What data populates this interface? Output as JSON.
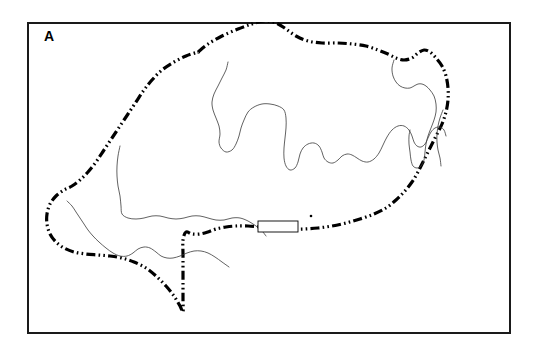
{
  "figure": {
    "panel_label": "A",
    "background_color": "#ffffff",
    "frame_color": "#1a1a1a",
    "boundary_color": "#000000",
    "contour_color": "#3a3a3a",
    "frame": {
      "x": 27,
      "y": 22,
      "width": 484,
      "height": 312
    }
  },
  "chart_data": {
    "type": "map",
    "title": "A",
    "xlabel": "",
    "ylabel": "",
    "grid": false,
    "legend": "none",
    "layers": [
      {
        "name": "island-boundary",
        "style": "dash-dot-dot",
        "stroke_width": 3.2,
        "color": "#000000",
        "closed": true,
        "points": [
          [
            198,
            52
          ],
          [
            208,
            44
          ],
          [
            222,
            36
          ],
          [
            238,
            29
          ],
          [
            252,
            24
          ],
          [
            264,
            21
          ],
          [
            276,
            23
          ],
          [
            286,
            29
          ],
          [
            296,
            36
          ],
          [
            308,
            41
          ],
          [
            322,
            43
          ],
          [
            338,
            43
          ],
          [
            352,
            44
          ],
          [
            366,
            46
          ],
          [
            378,
            50
          ],
          [
            388,
            54
          ],
          [
            396,
            58
          ],
          [
            404,
            60
          ],
          [
            412,
            58
          ],
          [
            418,
            53
          ],
          [
            424,
            50
          ],
          [
            430,
            52
          ],
          [
            436,
            58
          ],
          [
            442,
            66
          ],
          [
            446,
            76
          ],
          [
            448,
            88
          ],
          [
            448,
            100
          ],
          [
            446,
            112
          ],
          [
            442,
            124
          ],
          [
            436,
            136
          ],
          [
            430,
            148
          ],
          [
            424,
            160
          ],
          [
            418,
            172
          ],
          [
            412,
            182
          ],
          [
            404,
            192
          ],
          [
            396,
            200
          ],
          [
            386,
            208
          ],
          [
            374,
            214
          ],
          [
            360,
            219
          ],
          [
            346,
            223
          ],
          [
            332,
            226
          ],
          [
            318,
            228
          ],
          [
            304,
            229
          ],
          [
            290,
            229
          ],
          [
            276,
            228
          ],
          [
            262,
            227
          ],
          [
            248,
            226
          ],
          [
            236,
            226
          ],
          [
            226,
            227
          ],
          [
            216,
            229
          ],
          [
            208,
            232
          ],
          [
            200,
            234
          ],
          [
            192,
            234
          ],
          [
            186,
            232
          ],
          [
            183,
            240
          ],
          [
            183,
            254
          ],
          [
            183,
            270
          ],
          [
            183,
            286
          ],
          [
            183,
            300
          ],
          [
            183,
            312
          ],
          [
            180,
            306
          ],
          [
            174,
            296
          ],
          [
            166,
            286
          ],
          [
            156,
            276
          ],
          [
            146,
            268
          ],
          [
            134,
            262
          ],
          [
            122,
            258
          ],
          [
            110,
            256
          ],
          [
            98,
            255
          ],
          [
            86,
            254
          ],
          [
            74,
            252
          ],
          [
            64,
            248
          ],
          [
            56,
            242
          ],
          [
            50,
            234
          ],
          [
            47,
            224
          ],
          [
            47,
            214
          ],
          [
            50,
            204
          ],
          [
            56,
            196
          ],
          [
            64,
            190
          ],
          [
            72,
            186
          ],
          [
            80,
            180
          ],
          [
            88,
            172
          ],
          [
            96,
            162
          ],
          [
            104,
            150
          ],
          [
            112,
            138
          ],
          [
            120,
            126
          ],
          [
            128,
            114
          ],
          [
            136,
            102
          ],
          [
            144,
            90
          ],
          [
            152,
            80
          ],
          [
            162,
            70
          ],
          [
            174,
            62
          ],
          [
            186,
            56
          ],
          [
            198,
            52
          ]
        ]
      },
      {
        "name": "interior-contour-north",
        "style": "solid",
        "stroke_width": 0.8,
        "color": "#3a3a3a",
        "closed": false,
        "points": [
          [
            228,
            62
          ],
          [
            226,
            70
          ],
          [
            222,
            78
          ],
          [
            218,
            86
          ],
          [
            214,
            94
          ],
          [
            212,
            102
          ],
          [
            213,
            110
          ],
          [
            216,
            118
          ],
          [
            219,
            126
          ],
          [
            220,
            134
          ],
          [
            219,
            142
          ],
          [
            221,
            148
          ],
          [
            226,
            152
          ],
          [
            232,
            150
          ],
          [
            236,
            144
          ],
          [
            239,
            136
          ],
          [
            241,
            128
          ],
          [
            244,
            120
          ],
          [
            248,
            112
          ],
          [
            254,
            107
          ],
          [
            262,
            104
          ],
          [
            270,
            104
          ],
          [
            278,
            106
          ],
          [
            284,
            110
          ],
          [
            286,
            118
          ],
          [
            286,
            128
          ],
          [
            285,
            138
          ],
          [
            284,
            148
          ],
          [
            284,
            158
          ],
          [
            286,
            166
          ],
          [
            290,
            170
          ],
          [
            295,
            168
          ],
          [
            298,
            162
          ],
          [
            300,
            154
          ],
          [
            303,
            148
          ],
          [
            308,
            144
          ],
          [
            314,
            143
          ],
          [
            319,
            146
          ],
          [
            322,
            152
          ],
          [
            324,
            158
          ],
          [
            328,
            162
          ],
          [
            333,
            163
          ],
          [
            338,
            160
          ],
          [
            342,
            156
          ],
          [
            347,
            154
          ],
          [
            352,
            155
          ],
          [
            357,
            158
          ],
          [
            362,
            161
          ],
          [
            368,
            162
          ],
          [
            374,
            159
          ],
          [
            379,
            153
          ],
          [
            383,
            145
          ],
          [
            387,
            137
          ],
          [
            392,
            130
          ],
          [
            398,
            126
          ],
          [
            404,
            126
          ],
          [
            409,
            130
          ],
          [
            412,
            136
          ],
          [
            414,
            142
          ],
          [
            417,
            146
          ],
          [
            421,
            147
          ],
          [
            425,
            144
          ],
          [
            428,
            138
          ],
          [
            431,
            132
          ],
          [
            435,
            128
          ],
          [
            440,
            127
          ],
          [
            444,
            130
          ],
          [
            446,
            136
          ]
        ]
      },
      {
        "name": "interior-contour-northeast-inlet",
        "style": "solid",
        "stroke_width": 0.8,
        "color": "#3a3a3a",
        "closed": false,
        "points": [
          [
            394,
            60
          ],
          [
            392,
            68
          ],
          [
            393,
            76
          ],
          [
            396,
            82
          ],
          [
            400,
            86
          ],
          [
            405,
            88
          ],
          [
            410,
            88
          ],
          [
            414,
            86
          ],
          [
            418,
            84
          ],
          [
            422,
            84
          ],
          [
            426,
            86
          ],
          [
            430,
            90
          ],
          [
            434,
            96
          ],
          [
            436,
            104
          ],
          [
            436,
            112
          ],
          [
            434,
            120
          ],
          [
            431,
            128
          ],
          [
            428,
            136
          ],
          [
            426,
            144
          ],
          [
            425,
            152
          ],
          [
            424,
            160
          ],
          [
            421,
            166
          ],
          [
            417,
            168
          ],
          [
            413,
            166
          ],
          [
            411,
            160
          ],
          [
            410,
            152
          ],
          [
            409,
            144
          ],
          [
            409,
            136
          ],
          [
            410,
            130
          ]
        ]
      },
      {
        "name": "interior-contour-southwest",
        "style": "solid",
        "stroke_width": 0.8,
        "color": "#3a3a3a",
        "closed": false,
        "points": [
          [
            120,
            146
          ],
          [
            118,
            156
          ],
          [
            117,
            166
          ],
          [
            117,
            176
          ],
          [
            118,
            186
          ],
          [
            120,
            196
          ],
          [
            121,
            206
          ],
          [
            122,
            214
          ],
          [
            128,
            218
          ],
          [
            136,
            219
          ],
          [
            144,
            218
          ],
          [
            152,
            216
          ],
          [
            160,
            216
          ],
          [
            168,
            218
          ],
          [
            176,
            219
          ],
          [
            184,
            218
          ],
          [
            192,
            216
          ],
          [
            200,
            216
          ],
          [
            208,
            218
          ],
          [
            216,
            220
          ],
          [
            224,
            220
          ],
          [
            232,
            218
          ],
          [
            240,
            218
          ],
          [
            248,
            221
          ],
          [
            256,
            226
          ],
          [
            262,
            231
          ],
          [
            266,
            236
          ]
        ]
      },
      {
        "name": "interior-contour-west-peninsula",
        "style": "solid",
        "stroke_width": 0.8,
        "color": "#3a3a3a",
        "closed": false,
        "points": [
          [
            67,
            201
          ],
          [
            72,
            206
          ],
          [
            76,
            212
          ],
          [
            80,
            218
          ],
          [
            84,
            224
          ],
          [
            88,
            230
          ],
          [
            93,
            236
          ],
          [
            99,
            242
          ],
          [
            106,
            248
          ],
          [
            113,
            253
          ],
          [
            120,
            256
          ],
          [
            127,
            256
          ],
          [
            133,
            253
          ],
          [
            138,
            249
          ],
          [
            144,
            247
          ],
          [
            150,
            248
          ],
          [
            156,
            252
          ],
          [
            161,
            256
          ],
          [
            167,
            258
          ],
          [
            173,
            258
          ],
          [
            180,
            256
          ],
          [
            187,
            253
          ],
          [
            194,
            251
          ],
          [
            201,
            251
          ],
          [
            208,
            253
          ],
          [
            215,
            257
          ],
          [
            222,
            262
          ],
          [
            229,
            267
          ]
        ]
      },
      {
        "name": "interior-contour-northeast-tail",
        "style": "solid",
        "stroke_width": 0.8,
        "color": "#3a3a3a",
        "closed": false,
        "points": [
          [
            443,
            110
          ],
          [
            440,
            118
          ],
          [
            438,
            126
          ],
          [
            437,
            134
          ],
          [
            437,
            142
          ],
          [
            438,
            150
          ],
          [
            440,
            158
          ],
          [
            441,
            166
          ]
        ]
      }
    ],
    "markers": [
      {
        "name": "rectangle-marker",
        "shape": "rectangle",
        "x": 258,
        "y": 221,
        "width": 40,
        "height": 11,
        "fill": "#ffffff",
        "stroke": "#000000"
      },
      {
        "name": "point-marker",
        "shape": "dot",
        "x": 311,
        "y": 216,
        "radius": 1.3,
        "fill": "#000000"
      }
    ]
  }
}
